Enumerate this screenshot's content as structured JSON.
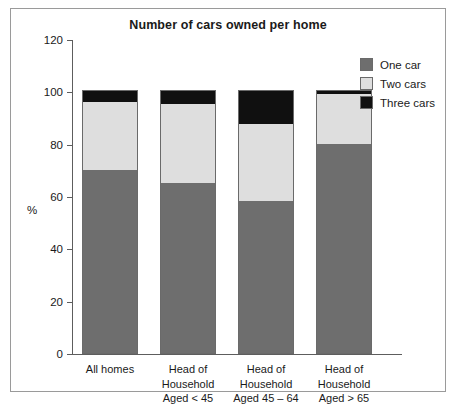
{
  "chart_data": {
    "type": "bar",
    "subtype": "stacked-column",
    "title": "Number of cars owned per home",
    "xlabel": "",
    "ylabel": "%",
    "ylim": [
      0,
      120
    ],
    "yticks": [
      0,
      20,
      40,
      60,
      80,
      100,
      120
    ],
    "ytick_labels": [
      "0",
      "20",
      "40",
      "60",
      "80",
      "100",
      "120"
    ],
    "grid": false,
    "legend_position": "top-right",
    "categories": [
      "All homes",
      "Head of Household Aged < 45",
      "Head of Household Aged 45 – 64",
      "Head of Household Aged > 65"
    ],
    "category_lines": [
      [
        "All homes"
      ],
      [
        "Head of",
        "Household",
        "Aged < 45"
      ],
      [
        "Head of",
        "Household",
        "Aged 45 – 64"
      ],
      [
        "Head of",
        "Household",
        "Aged > 65"
      ]
    ],
    "series": [
      {
        "name": "One car",
        "color": "#6e6e6e",
        "values": [
          70,
          65,
          58,
          80
        ]
      },
      {
        "name": "Two cars",
        "color": "#dedede",
        "values": [
          26,
          30,
          29.5,
          19
        ]
      },
      {
        "name": "Three cars",
        "color": "#101010",
        "values": [
          4,
          5,
          12.5,
          1
        ]
      }
    ],
    "totals": [
      100,
      100,
      100,
      100
    ]
  },
  "legend": {
    "items": [
      {
        "label": "One car",
        "swatch": "one"
      },
      {
        "label": "Two cars",
        "swatch": "two"
      },
      {
        "label": "Three cars",
        "swatch": "three"
      }
    ]
  },
  "colors": {
    "one_car": "#6e6e6e",
    "two_cars": "#dedede",
    "three_cars": "#101010",
    "axis": "#5d5d5d",
    "border": "#9a9a9a"
  }
}
